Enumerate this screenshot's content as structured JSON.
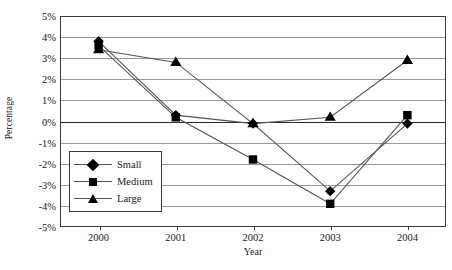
{
  "chart_data": {
    "type": "line",
    "title": "",
    "xlabel": "Year",
    "ylabel": "Percentage",
    "categories": [
      "2000",
      "2001",
      "2002",
      "2003",
      "2004"
    ],
    "x": [
      2000,
      2001,
      2002,
      2003,
      2004
    ],
    "series": [
      {
        "name": "Small",
        "marker": "diamond",
        "values": [
          3.8,
          0.3,
          -0.1,
          -3.3,
          -0.1
        ]
      },
      {
        "name": "Medium",
        "marker": "square",
        "values": [
          3.6,
          0.2,
          -1.8,
          -3.9,
          0.3
        ]
      },
      {
        "name": "Large",
        "marker": "triangle",
        "values": [
          3.4,
          2.8,
          -0.1,
          0.2,
          2.9
        ]
      }
    ],
    "ylim": [
      -5,
      5
    ],
    "ytick_step": 1,
    "ytick_labels": [
      "5%",
      "4%",
      "3%",
      "2%",
      "1%",
      "0%",
      "-1%",
      "-2%",
      "-3%",
      "-4%",
      "-5%"
    ],
    "ytick_values": [
      5,
      4,
      3,
      2,
      1,
      0,
      -1,
      -2,
      -3,
      -4,
      -5
    ],
    "grid": true,
    "grid_axis": "y",
    "legend_position": "inside-lower-left",
    "legend_entries": [
      "Small",
      "Medium",
      "Large"
    ],
    "colors": {
      "line": "#555555",
      "marker": "#000000",
      "grid": "#9a9a9a",
      "axis": "#3a3a3a",
      "zero_line": "#2a2a2a",
      "background": "#ffffff",
      "text": "#1a1a1a"
    }
  }
}
